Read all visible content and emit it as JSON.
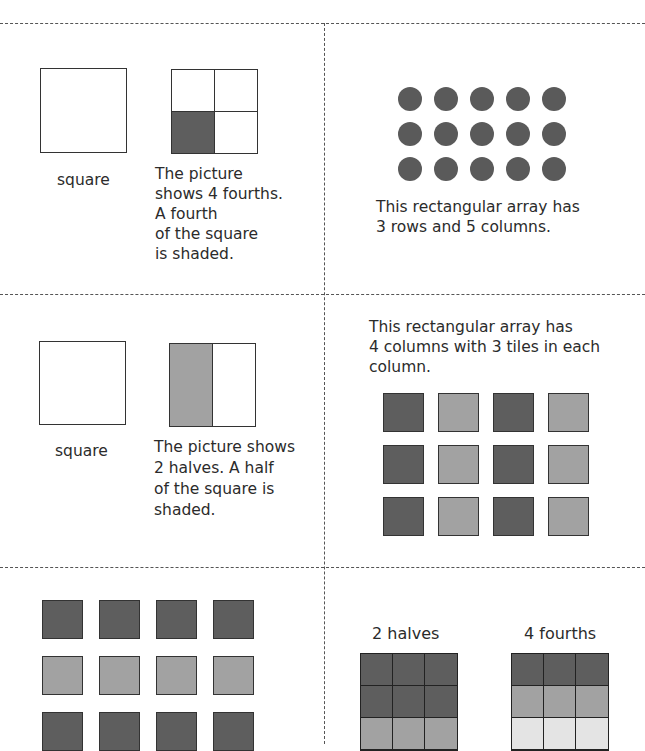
{
  "colors": {
    "dark": "#5e5e5e",
    "mid": "#a2a2a2",
    "light": "#e4e4e4",
    "dot": "#5a5a5a"
  },
  "cards": {
    "fourths": {
      "square_label": "square",
      "description": "The picture\nshows 4 fourths.\nA fourth\nof the square\nis shaded.",
      "shaded_quadrant": "bottom-left"
    },
    "dot_array": {
      "rows": 3,
      "columns": 5,
      "description": "This rectangular array has\n3 rows and 5 columns."
    },
    "halves": {
      "square_label": "square",
      "description": "The picture shows\n2 halves. A half\nof the square is\nshaded.",
      "shaded_half": "left"
    },
    "tile_array_columns": {
      "description": "This rectangular array has\n4 columns with 3 tiles in each\ncolumn.",
      "rows": [
        [
          "dark",
          "mid",
          "dark",
          "mid"
        ],
        [
          "dark",
          "mid",
          "dark",
          "mid"
        ],
        [
          "dark",
          "mid",
          "dark",
          "mid"
        ]
      ]
    },
    "tile_array_rows": {
      "rows": [
        [
          "dark",
          "dark",
          "dark",
          "dark"
        ],
        [
          "mid",
          "mid",
          "mid",
          "mid"
        ],
        [
          "dark",
          "dark",
          "dark",
          "dark"
        ]
      ]
    },
    "halves_fourths_grids": {
      "halves_label": "2 halves",
      "fourths_label": "4 fourths",
      "halves_rows": [
        "dark",
        "dark",
        "mid"
      ],
      "fourths_rows": [
        "dark",
        "mid",
        "light"
      ]
    }
  }
}
